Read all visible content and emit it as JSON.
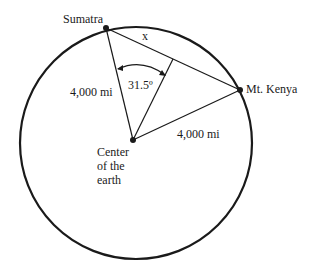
{
  "diagram": {
    "points": {
      "sumatra": {
        "label": "Sumatra"
      },
      "mt_kenya": {
        "label": "Mt. Kenya"
      },
      "center": {
        "label_lines": [
          "Center",
          "of the",
          "earth"
        ]
      }
    },
    "labels": {
      "chord": "x",
      "radius_left": "4,000 mi",
      "radius_right": "4,000 mi",
      "angle": "31.5º"
    },
    "colors": {
      "stroke": "#1a1a1a",
      "background": "#ffffff"
    }
  }
}
